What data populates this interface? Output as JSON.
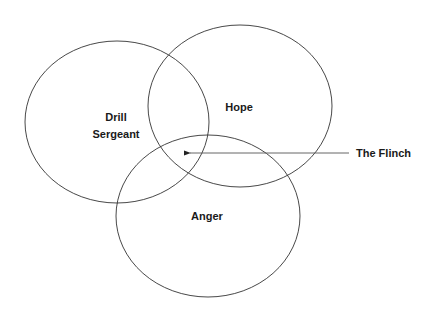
{
  "diagram": {
    "type": "venn",
    "stroke_color": "#333333",
    "arrow_color": "#555555",
    "circles": [
      {
        "id": "drill-sergeant",
        "label_line1": "Drill",
        "label_line2": "Sergeant",
        "cx": 117,
        "cy": 122,
        "rx": 92,
        "ry": 81
      },
      {
        "id": "hope",
        "label": "Hope",
        "cx": 240,
        "cy": 106,
        "rx": 92,
        "ry": 81
      },
      {
        "id": "anger",
        "label": "Anger",
        "cx": 208,
        "cy": 216,
        "rx": 92,
        "ry": 81
      }
    ],
    "annotation": {
      "label": "The Flinch",
      "points_to": "intersection of Drill Sergeant, Hope and Anger"
    }
  }
}
